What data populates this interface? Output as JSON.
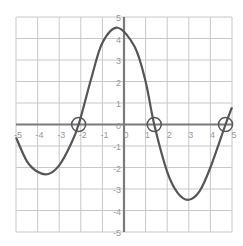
{
  "chart_data": {
    "type": "line",
    "title": "",
    "xlabel": "",
    "ylabel": "",
    "xlim": [
      -5,
      5
    ],
    "ylim": [
      -5,
      5
    ],
    "grid": true,
    "x_ticks": [
      "-5",
      "-4",
      "-3",
      "-2",
      "-1",
      "0",
      "1",
      "2",
      "3",
      "4",
      "5"
    ],
    "y_ticks": [
      "5",
      "4",
      "3",
      "2",
      "1",
      "0",
      "-1",
      "-2",
      "-3",
      "-4",
      "-5"
    ],
    "series": [
      {
        "name": "curve",
        "x": [
          -5,
          -4.5,
          -4,
          -3.5,
          -3,
          -2.5,
          -2.1,
          -1.5,
          -1,
          -0.3,
          0.5,
          1,
          1.4,
          2,
          2.5,
          3,
          3.5,
          4,
          4.7,
          5
        ],
        "y": [
          -0.6,
          -1.7,
          -2.2,
          -2.3,
          -1.9,
          -1.0,
          0,
          2.2,
          3.8,
          4.5,
          3.6,
          2.0,
          0,
          -2.2,
          -3.2,
          -3.5,
          -3.1,
          -2.0,
          0,
          0.8
        ]
      }
    ],
    "annotations": [
      {
        "type": "circle",
        "x": -2.1,
        "y": 0,
        "label": "root"
      },
      {
        "type": "circle",
        "x": 1.4,
        "y": 0,
        "label": "root"
      },
      {
        "type": "circle",
        "x": 4.7,
        "y": 0,
        "label": "root"
      }
    ]
  },
  "colors": {
    "grid": "#c8c8c8",
    "axis": "#7a7a7a",
    "curve": "#555555",
    "tick": "#999999"
  }
}
